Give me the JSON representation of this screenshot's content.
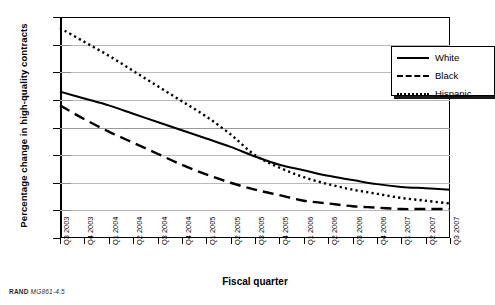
{
  "chart_data": {
    "type": "line",
    "title": "",
    "xlabel": "Fiscal quarter",
    "ylabel": "Percentage change in high-quality contracts",
    "ylim": [
      -80,
      80
    ],
    "yticks": [
      80,
      60,
      40,
      20,
      0,
      -20,
      -40,
      -60,
      -80
    ],
    "grid": true,
    "legend_position": "top-right",
    "categories": [
      "Q3 2003",
      "Q4 2003",
      "Q1 2004",
      "Q2 2004",
      "Q3 2004",
      "Q4 2004",
      "Q1 2005",
      "Q2 2005",
      "Q3 2005",
      "Q4 2005",
      "Q1 2006",
      "Q2 2006",
      "Q3 2006",
      "Q4 2006",
      "Q1 2007",
      "Q2 2007",
      "Q3 2007"
    ],
    "series": [
      {
        "name": "White",
        "style": "solid",
        "values": [
          26,
          21,
          16,
          10,
          4,
          -2,
          -8,
          -14,
          -21,
          -27,
          -31,
          -35,
          -38,
          -41,
          -43,
          -44,
          -45
        ]
      },
      {
        "name": "Black",
        "style": "dashed",
        "values": [
          16,
          6,
          -3,
          -11,
          -19,
          -27,
          -34,
          -40,
          -45,
          -49,
          -53,
          -55,
          -57,
          -58,
          -59,
          -59,
          -59
        ]
      },
      {
        "name": "Hispanic",
        "style": "dotted",
        "values": [
          72,
          62,
          52,
          41,
          30,
          19,
          8,
          -5,
          -20,
          -29,
          -36,
          -41,
          -45,
          -48,
          -51,
          -53,
          -55
        ]
      }
    ]
  },
  "legend": {
    "items": [
      {
        "label": "White",
        "style": "solid"
      },
      {
        "label": "Black",
        "style": "dashed"
      },
      {
        "label": "Hispanic",
        "style": "dotted"
      }
    ]
  },
  "caption": {
    "prefix": "RAND",
    "id": "MG861-4.5"
  }
}
